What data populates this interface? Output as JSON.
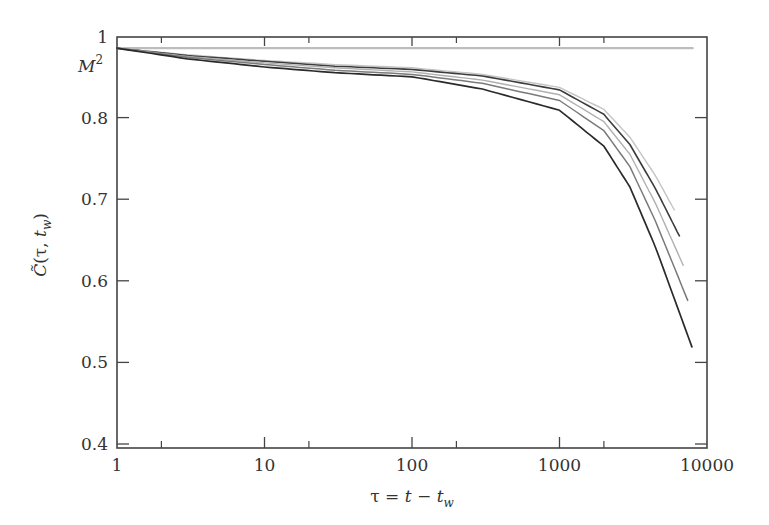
{
  "chart_data": {
    "type": "line",
    "title": "",
    "xlabel": "τ = t − t_w",
    "ylabel": "C̃(τ, t_w)",
    "xscale": "log",
    "xlim": [
      1,
      10000
    ],
    "ylim": [
      0.4,
      0.9
    ],
    "grid": false,
    "legend": "none",
    "x_ticks": [
      {
        "value": 1,
        "label": "1"
      },
      {
        "value": 10,
        "label": "10"
      },
      {
        "value": 100,
        "label": "100"
      },
      {
        "value": 1000,
        "label": "1000"
      },
      {
        "value": 10000,
        "label": "10000"
      }
    ],
    "x_minor_ticks": [
      2,
      20,
      200,
      2000
    ],
    "y_ticks": [
      {
        "value": 0.4,
        "label": "0.4"
      },
      {
        "value": 0.5,
        "label": "0.5"
      },
      {
        "value": 0.6,
        "label": "0.6"
      },
      {
        "value": 0.7,
        "label": "0.7"
      },
      {
        "value": 0.8,
        "label": "0.8"
      },
      {
        "value": 0.9,
        "label": "1"
      }
    ],
    "annotations": [
      {
        "text": "M²",
        "y": 0.865,
        "note": "plateau level label on y-axis"
      }
    ],
    "series": [
      {
        "name": "plateau (M²)",
        "color": "#bdbdbd",
        "width": 2.2,
        "x": [
          1,
          8000
        ],
        "y": [
          0.885,
          0.885
        ]
      },
      {
        "name": "curve 1",
        "color": "#c4c4c4",
        "width": 1.4,
        "x": [
          1,
          3,
          10,
          30,
          100,
          300,
          1000,
          2000,
          3000,
          4500,
          6000
        ],
        "y": [
          0.885,
          0.877,
          0.87,
          0.865,
          0.861,
          0.853,
          0.837,
          0.81,
          0.776,
          0.728,
          0.687
        ]
      },
      {
        "name": "curve 2",
        "color": "#3c3c3c",
        "width": 1.6,
        "x": [
          1,
          3,
          10,
          30,
          100,
          300,
          1000,
          2000,
          3000,
          4500,
          6500
        ],
        "y": [
          0.885,
          0.876,
          0.869,
          0.863,
          0.859,
          0.851,
          0.834,
          0.804,
          0.767,
          0.712,
          0.655
        ]
      },
      {
        "name": "curve 3",
        "color": "#b0b0b0",
        "width": 1.4,
        "x": [
          1,
          3,
          10,
          30,
          100,
          300,
          1000,
          2000,
          3000,
          4500,
          6900
        ],
        "y": [
          0.885,
          0.875,
          0.867,
          0.861,
          0.856,
          0.846,
          0.828,
          0.795,
          0.755,
          0.694,
          0.619
        ]
      },
      {
        "name": "curve 4",
        "color": "#7a7a7a",
        "width": 1.5,
        "x": [
          1,
          3,
          10,
          30,
          100,
          300,
          1000,
          2000,
          3000,
          4500,
          7400
        ],
        "y": [
          0.885,
          0.874,
          0.865,
          0.858,
          0.853,
          0.842,
          0.821,
          0.784,
          0.74,
          0.672,
          0.576
        ]
      },
      {
        "name": "curve 5",
        "color": "#2a2a2a",
        "width": 1.7,
        "x": [
          1,
          3,
          10,
          30,
          100,
          300,
          1000,
          2000,
          3000,
          4500,
          7900
        ],
        "y": [
          0.885,
          0.872,
          0.862,
          0.855,
          0.85,
          0.835,
          0.809,
          0.765,
          0.715,
          0.64,
          0.519
        ]
      }
    ]
  },
  "labels": {
    "m_squared_base": "M",
    "m_squared_sup": "2",
    "x_title_parts": [
      "τ = ",
      "t",
      " − ",
      "t",
      "w"
    ],
    "y_title_parts": [
      "C̃",
      "(τ, ",
      "t",
      "w",
      ")"
    ]
  }
}
